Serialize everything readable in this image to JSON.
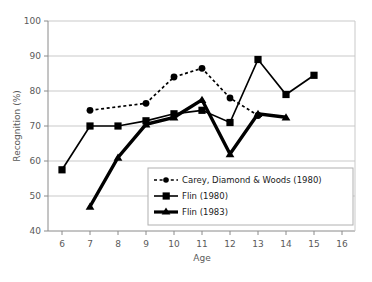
{
  "chart_data": {
    "type": "line",
    "title": "",
    "xlabel": "Age",
    "ylabel": "Recognition (%)",
    "xlim": [
      6,
      16
    ],
    "ylim": [
      40,
      100
    ],
    "xticks": [
      6,
      7,
      8,
      9,
      10,
      11,
      12,
      13,
      14,
      15,
      16
    ],
    "yticks": [
      40,
      50,
      60,
      70,
      80,
      90,
      100
    ],
    "grid": "horizontal",
    "legend_position": "inside-bottom-center",
    "series": [
      {
        "name": "Carey, Diamond & Woods (1980)",
        "marker": "circle",
        "line": "dashed",
        "color": "#000000",
        "x": [
          7,
          9,
          10,
          11,
          12,
          13
        ],
        "values": [
          74.5,
          76.5,
          84,
          86.5,
          78,
          73
        ]
      },
      {
        "name": "Flin (1980)",
        "marker": "square",
        "line": "solid",
        "color": "#000000",
        "x": [
          6,
          7,
          8,
          9,
          10,
          11,
          12,
          13,
          14,
          15
        ],
        "values": [
          57.5,
          70,
          70,
          71.5,
          73.5,
          74.5,
          71,
          89,
          79,
          84.5
        ]
      },
      {
        "name": "Flin (1983)",
        "marker": "triangle",
        "line": "solid-thick",
        "color": "#000000",
        "x": [
          7,
          8,
          9,
          10,
          11,
          12,
          13,
          14
        ],
        "values": [
          47,
          61,
          70.5,
          72.5,
          77.5,
          62,
          73.5,
          72.5
        ]
      }
    ]
  },
  "axis": {
    "ylabel": "Recognition (%)",
    "xlabel": "Age",
    "ytick_labels": [
      "100",
      "90",
      "80",
      "70",
      "60",
      "50",
      "40"
    ],
    "xtick_labels": [
      "6",
      "7",
      "8",
      "9",
      "10",
      "11",
      "12",
      "13",
      "14",
      "15",
      "16"
    ]
  },
  "legend": {
    "entries": [
      {
        "label": "Carey, Diamond & Woods (1980)",
        "marker": "circle",
        "line": "dashed"
      },
      {
        "label": "Flin (1980)",
        "marker": "square",
        "line": "solid"
      },
      {
        "label": "Flin (1983)",
        "marker": "triangle",
        "line": "solid-thick"
      }
    ]
  },
  "colors": {
    "series": "#000000",
    "grid": "#c9c9c9",
    "axis": "#8a8a8a",
    "tick_label": "#5a5a5a",
    "background": "#ffffff"
  }
}
